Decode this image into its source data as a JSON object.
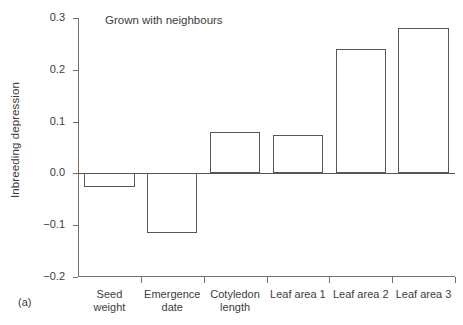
{
  "figure": {
    "panel_label": "(a)",
    "title": "Grown with neighbours",
    "ylabel": "Inbreeding depression"
  },
  "chart_data": {
    "type": "bar",
    "title": "Grown with neighbours",
    "xlabel": "",
    "ylabel": "Inbreeding depression",
    "ylim": [
      -0.2,
      0.3
    ],
    "ytick_labels": [
      "0.3",
      "0.2",
      "0.1",
      "0.0",
      "-0.1",
      "-0.2"
    ],
    "ytick_values": [
      0.3,
      0.2,
      0.1,
      0.0,
      -0.1,
      -0.2
    ],
    "grid": false,
    "legend": "none",
    "baseline": 0.0,
    "bar_style": "open outline",
    "categories": [
      "Seed weight",
      "Emergence date",
      "Cotyledon length",
      "Leaf area 1",
      "Leaf area 2",
      "Leaf area 3"
    ],
    "category_lines": [
      [
        "Seed",
        "weight"
      ],
      [
        "Emergence",
        "date"
      ],
      [
        "Cotyledon",
        "length"
      ],
      [
        "Leaf area 1"
      ],
      [
        "Leaf area 2"
      ],
      [
        "Leaf area 3"
      ]
    ],
    "values": [
      -0.027,
      -0.115,
      0.079,
      0.075,
      0.24,
      0.28
    ]
  },
  "colors": {
    "axis": "#6f6f6f",
    "bar_outline": "#575757",
    "text": "#3d3d3d",
    "background": "#ffffff"
  }
}
